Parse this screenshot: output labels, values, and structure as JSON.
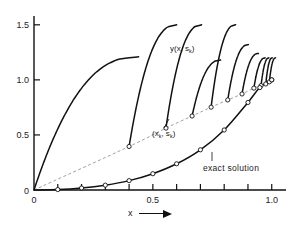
{
  "chart_data": {
    "type": "line",
    "title": "",
    "xlabel": "x",
    "ylabel": "",
    "xlim": [
      0.0,
      1.06
    ],
    "ylim": [
      0.0,
      1.58
    ],
    "grid": false,
    "legend": "none",
    "x_ticks": [
      0.0,
      0.1,
      0.2,
      0.3,
      0.4,
      0.5,
      0.6,
      0.7,
      0.8,
      0.9,
      1.0
    ],
    "x_tick_labels": [
      "0",
      "",
      "",
      "",
      "",
      "0.5",
      "",
      "",
      "",
      "",
      "1.0"
    ],
    "y_ticks": [
      0.0,
      0.5,
      1.0,
      1.5
    ],
    "y_tick_labels": [
      "0",
      "0.5",
      "1.0",
      "1.5"
    ],
    "annotations": [
      {
        "name": "shooting-family-label",
        "text": "y(x, s",
        "sub": "k",
        "tail": ")",
        "x": 0.575,
        "y": 1.2
      },
      {
        "name": "node-point-label",
        "text": "(x",
        "sub": "k",
        "mid": ", s",
        "sub2": "k",
        "tail": ")",
        "x": 0.515,
        "y": 0.625
      },
      {
        "name": "exact-solution-label",
        "text": "exact solution",
        "x": 0.795,
        "y": 0.33
      }
    ],
    "series": [
      {
        "name": "exact solution",
        "style": "solid",
        "marker": "open-circle",
        "x": [
          0.0,
          0.1,
          0.2,
          0.3,
          0.4,
          0.5,
          0.6,
          0.7,
          0.8,
          0.9,
          0.95,
          1.0
        ],
        "y": [
          0.0,
          0.004,
          0.018,
          0.044,
          0.085,
          0.148,
          0.238,
          0.365,
          0.545,
          0.795,
          0.93,
          1.0
        ]
      },
      {
        "name": "nodes (x_k, s_k)",
        "style": "dashed",
        "marker": "open-circle",
        "x": [
          0.0,
          0.4,
          0.555,
          0.665,
          0.745,
          0.815,
          0.875,
          0.925,
          0.955,
          0.975,
          0.99,
          1.0
        ],
        "y": [
          0.0,
          0.395,
          0.562,
          0.672,
          0.752,
          0.818,
          0.872,
          0.925,
          0.948,
          0.963,
          0.982,
          1.0
        ]
      },
      {
        "name": "y(x, s_0)",
        "style": "solid",
        "start_x": 0.0,
        "start_y": 0.0,
        "blowup_x": 0.44,
        "top_y": 1.21
      },
      {
        "name": "y(x, s_1)",
        "style": "solid",
        "start_x": 0.4,
        "start_y": 0.395,
        "blowup_x": 0.6,
        "top_y": 1.5
      },
      {
        "name": "y(x, s_2)",
        "style": "solid",
        "start_x": 0.555,
        "start_y": 0.562,
        "blowup_x": 0.705,
        "top_y": 1.5
      },
      {
        "name": "y(x, s_3)",
        "style": "solid",
        "start_x": 0.665,
        "start_y": 0.672,
        "blowup_x": 0.785,
        "top_y": 1.18
      },
      {
        "name": "y(x, s_4)",
        "style": "solid",
        "start_x": 0.745,
        "start_y": 0.752,
        "blowup_x": 0.848,
        "top_y": 1.5
      },
      {
        "name": "y(x, s_5)",
        "style": "solid",
        "start_x": 0.815,
        "start_y": 0.818,
        "blowup_x": 0.902,
        "top_y": 1.32
      },
      {
        "name": "y(x, s_6)",
        "style": "solid",
        "start_x": 0.875,
        "start_y": 0.872,
        "blowup_x": 0.944,
        "top_y": 1.24
      },
      {
        "name": "y(x, s_7)",
        "style": "solid",
        "start_x": 0.925,
        "start_y": 0.925,
        "blowup_x": 0.972,
        "top_y": 1.2
      },
      {
        "name": "y(x, s_8)",
        "style": "solid",
        "start_x": 0.955,
        "start_y": 0.948,
        "blowup_x": 0.988,
        "top_y": 1.2
      },
      {
        "name": "y(x, s_9)",
        "style": "solid",
        "start_x": 0.975,
        "start_y": 0.963,
        "blowup_x": 1.002,
        "top_y": 1.2
      },
      {
        "name": "y(x, s_10)",
        "style": "solid",
        "start_x": 0.99,
        "start_y": 0.982,
        "blowup_x": 1.016,
        "top_y": 1.2
      }
    ]
  },
  "axes": {
    "x_axis_title": "x",
    "arrow_glyph": "arrow-right"
  }
}
